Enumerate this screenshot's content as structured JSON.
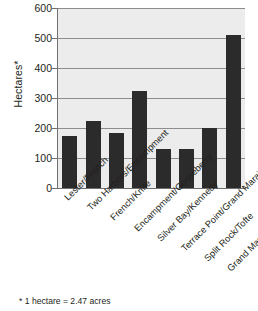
{
  "chart_data": {
    "type": "bar",
    "title": "",
    "xlabel": "",
    "ylabel": "Hectares*",
    "ylim": [
      0,
      600
    ],
    "yticks": [
      0,
      100,
      200,
      300,
      400,
      500,
      600
    ],
    "ytick_labels": [
      "0",
      "100",
      "200",
      "300",
      "400",
      "500",
      "600"
    ],
    "grid": true,
    "legend": "none",
    "categories": [
      "Lester/French",
      "Two Harbors/Encampment",
      "French/Knife",
      "Encampment/Gooseberry",
      "Silver Bay/Kennedy",
      "Terrace Point/Grand Marais",
      "Split Rock/Tofte",
      "Grand Marais/Red Cliff"
    ],
    "values": [
      172,
      222,
      185,
      322,
      130,
      130,
      200,
      510
    ],
    "bar_color": "#2b2b2b",
    "plot_background": "#ececec",
    "gridline_color": "#8d8d8d"
  },
  "footnote": {
    "text": "* 1 hectare = 2.47 acres"
  }
}
